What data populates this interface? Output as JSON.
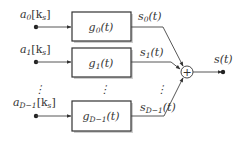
{
  "diagram": {
    "type": "block-diagram",
    "inputs": [
      {
        "symbol": "a",
        "sub": "0",
        "arg": "[k",
        "argsub": "s",
        "close": "]"
      },
      {
        "symbol": "a",
        "sub": "1",
        "arg": "[k",
        "argsub": "s",
        "close": "]"
      },
      {
        "symbol": "a",
        "sub": "D−1",
        "arg": "[k",
        "argsub": "s",
        "close": "]"
      }
    ],
    "blocks": [
      {
        "symbol": "g",
        "sub": "0",
        "arg": "(t)"
      },
      {
        "symbol": "g",
        "sub": "1",
        "arg": "(t)"
      },
      {
        "symbol": "g",
        "sub": "D−1",
        "arg": "(t)"
      }
    ],
    "signals": [
      {
        "symbol": "s",
        "sub": "0",
        "arg": "(t)"
      },
      {
        "symbol": "s",
        "sub": "1",
        "arg": "(t)"
      },
      {
        "symbol": "s",
        "sub": "D−1",
        "arg": "(t)"
      }
    ],
    "summer": {
      "symbol": "+"
    },
    "output": {
      "symbol": "s(t)"
    },
    "ellipsis": "⋮",
    "colors": {
      "line": "#444444",
      "box_border": "#333333",
      "shadow": "#cfcfcf",
      "text": "#333333"
    }
  }
}
